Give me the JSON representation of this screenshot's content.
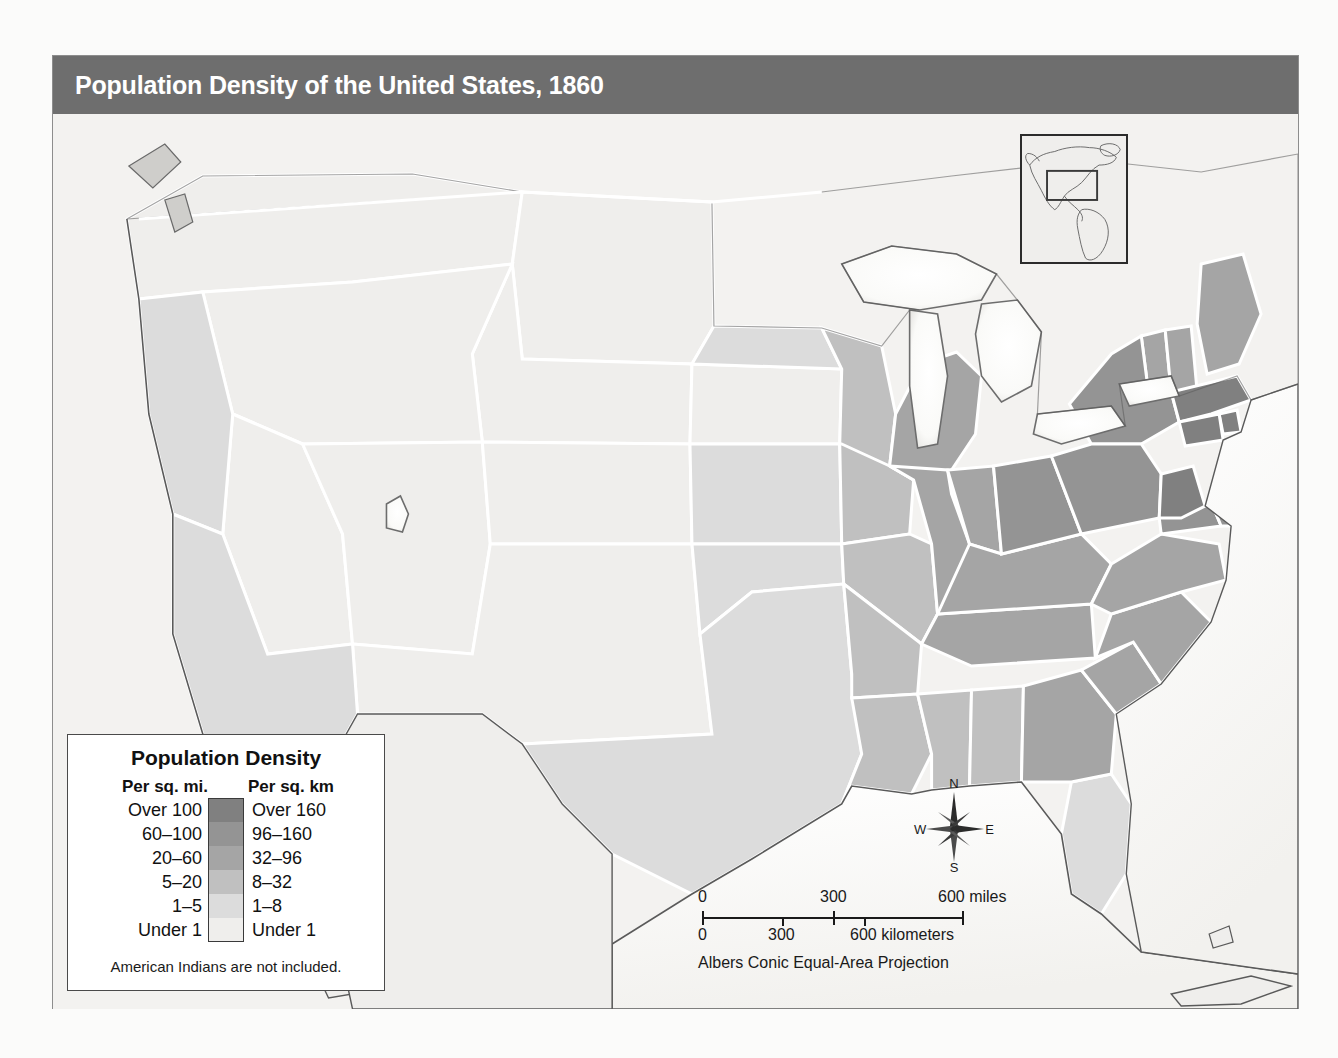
{
  "title": "Population Density of the United States, 1860",
  "legend": {
    "heading": "Population Density",
    "col_left_header": "Per sq. mi.",
    "col_right_header": "Per sq. km",
    "note": "American Indians are not included.",
    "classes": [
      {
        "per_sq_mi": "Over 100",
        "per_sq_km": "Over 160",
        "color": "#808080"
      },
      {
        "per_sq_mi": "60–100",
        "per_sq_km": "96–160",
        "color": "#949494"
      },
      {
        "per_sq_mi": "20–60",
        "per_sq_km": "32–96",
        "color": "#a5a5a5"
      },
      {
        "per_sq_mi": "5–20",
        "per_sq_km": "8–32",
        "color": "#c0c0c0"
      },
      {
        "per_sq_mi": "1–5",
        "per_sq_km": "1–8",
        "color": "#dcdcdc"
      },
      {
        "per_sq_mi": "Under 1",
        "per_sq_km": "Under 1",
        "color": "#efeeec"
      }
    ]
  },
  "compass": {
    "north": "N",
    "east": "E",
    "south": "S",
    "west": "W"
  },
  "scale": {
    "miles": {
      "labels": [
        "0",
        "300",
        "600 miles"
      ]
    },
    "kilometers": {
      "labels": [
        "0",
        "300",
        "600 kilometers"
      ]
    },
    "projection": "Albers Conic Equal-Area Projection"
  },
  "inset": {
    "name": "americas-locator-inset"
  },
  "colors": {
    "title_bar": "#6e6e6e",
    "title_text": "#ffffff",
    "map_background": "#f2f1ef",
    "water": "#ffffff",
    "border_line": "#ffffff",
    "coast_line": "#555555",
    "page_background": "#fbfbfa"
  },
  "map_regions": [
    {
      "name": "Massachusetts",
      "class": "Over 100"
    },
    {
      "name": "Rhode Island",
      "class": "Over 100"
    },
    {
      "name": "Connecticut",
      "class": "Over 100"
    },
    {
      "name": "New Jersey",
      "class": "Over 100"
    },
    {
      "name": "New York",
      "class": "60–100"
    },
    {
      "name": "Pennsylvania",
      "class": "60–100"
    },
    {
      "name": "Maryland",
      "class": "60–100"
    },
    {
      "name": "Delaware",
      "class": "60–100"
    },
    {
      "name": "Ohio",
      "class": "60–100"
    },
    {
      "name": "New Hampshire",
      "class": "20–60"
    },
    {
      "name": "Vermont",
      "class": "20–60"
    },
    {
      "name": "Maine",
      "class": "20–60"
    },
    {
      "name": "Virginia",
      "class": "20–60"
    },
    {
      "name": "North Carolina",
      "class": "20–60"
    },
    {
      "name": "South Carolina",
      "class": "20–60"
    },
    {
      "name": "Kentucky",
      "class": "20–60"
    },
    {
      "name": "Tennessee",
      "class": "20–60"
    },
    {
      "name": "Indiana",
      "class": "20–60"
    },
    {
      "name": "Illinois",
      "class": "20–60"
    },
    {
      "name": "Michigan",
      "class": "20–60"
    },
    {
      "name": "Wisconsin",
      "class": "5–20"
    },
    {
      "name": "Missouri",
      "class": "5–20"
    },
    {
      "name": "Georgia",
      "class": "20–60"
    },
    {
      "name": "Alabama",
      "class": "5–20"
    },
    {
      "name": "Mississippi",
      "class": "5–20"
    },
    {
      "name": "Louisiana",
      "class": "5–20"
    },
    {
      "name": "Arkansas",
      "class": "5–20"
    },
    {
      "name": "Florida",
      "class": "1–5"
    },
    {
      "name": "Iowa",
      "class": "5–20"
    },
    {
      "name": "Minnesota",
      "class": "1–5"
    },
    {
      "name": "Texas",
      "class": "1–5"
    },
    {
      "name": "Kansas",
      "class": "1–5"
    },
    {
      "name": "Nebraska",
      "class": "Under 1"
    },
    {
      "name": "California",
      "class": "1–5"
    },
    {
      "name": "Oregon",
      "class": "1–5"
    },
    {
      "name": "Washington Territory",
      "class": "Under 1"
    },
    {
      "name": "Dakota Territory",
      "class": "Under 1"
    },
    {
      "name": "Nevada Territory",
      "class": "Under 1"
    },
    {
      "name": "Utah Territory",
      "class": "Under 1"
    },
    {
      "name": "Colorado Territory",
      "class": "Under 1"
    },
    {
      "name": "New Mexico Territory",
      "class": "Under 1"
    },
    {
      "name": "Indian Territory",
      "class": "1–5"
    },
    {
      "name": "Nebraska Territory",
      "class": "Under 1"
    }
  ]
}
